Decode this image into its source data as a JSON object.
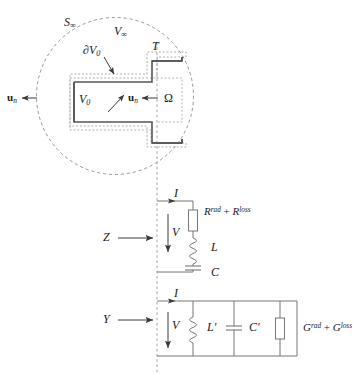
{
  "figure": {
    "colors": {
      "line": "#6e6e6e",
      "conductor": "#4a4a4a",
      "text": "#1a1a1a",
      "background": "#ffffff"
    }
  },
  "geometry": {
    "labels": {
      "s_infinity": "S",
      "s_infinity_sub": "∞",
      "v_infinity": "V",
      "v_infinity_sub": "∞",
      "terminal": "T",
      "boundary_v0": "∂V",
      "boundary_v0_sub": "0",
      "volume_v0": "V",
      "volume_v0_sub": "0",
      "omega": "Ω",
      "normal_left": "u",
      "normal_left_sub": "n",
      "normal_inner": "u",
      "normal_inner_sub": "n"
    }
  },
  "series_circuit": {
    "impedance_label": "Z",
    "current_label": "I",
    "voltage_label": "V",
    "resistor": {
      "symbol_a": "R",
      "sup_a": "rad",
      "operator": "+",
      "symbol_b": "R",
      "sup_b": "loss"
    },
    "inductor_label": "L",
    "capacitor_label": "C"
  },
  "parallel_circuit": {
    "admittance_label": "Y",
    "current_label": "I",
    "voltage_label": "V",
    "inductor_label": "L′",
    "capacitor_label": "C′",
    "conductance": {
      "symbol_a": "G",
      "sup_a": "rad",
      "operator": "+",
      "symbol_b": "G",
      "sup_b": "loss"
    }
  }
}
